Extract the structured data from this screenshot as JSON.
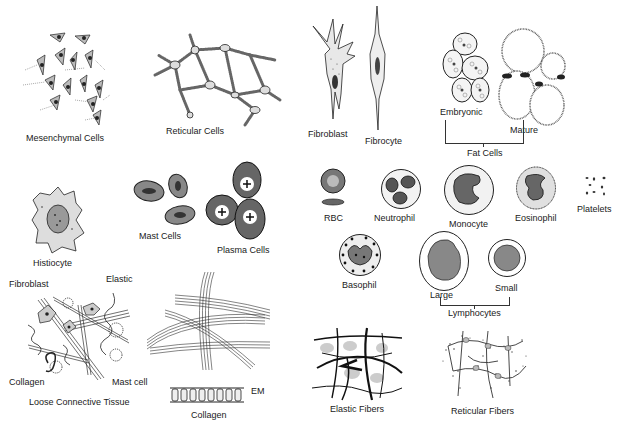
{
  "figure": {
    "labels": {
      "mesenchymal": "Mesenchymal Cells",
      "reticular_cells": "Reticular Cells",
      "fibroblast": "Fibroblast",
      "fibrocyte": "Fibrocyte",
      "embryonic": "Embryonic",
      "mature": "Mature",
      "fat_cells": "Fat Cells",
      "histiocyte": "Histiocyte",
      "mast_cells": "Mast Cells",
      "plasma_cells": "Plasma Cells",
      "rbc": "RBC",
      "neutrophil": "Neutrophil",
      "monocyte": "Monocyte",
      "eosinophil": "Eosinophil",
      "platelets": "Platelets",
      "basophil": "Basophil",
      "large": "Large",
      "small": "Small",
      "lymphocytes": "Lymphocytes",
      "lct_fibroblast": "Fibroblast",
      "lct_elastic": "Elastic",
      "lct_collagen": "Collagen",
      "lct_mast_cell": "Mast cell",
      "loose_ct": "Loose Connective Tissue",
      "em": "EM",
      "collagen": "Collagen",
      "elastic_fibers": "Elastic Fibers",
      "reticular_fibers": "Reticular Fibers"
    },
    "colors": {
      "ink": "#1a1a1a",
      "background": "#ffffff",
      "stipple": "#555555"
    }
  }
}
